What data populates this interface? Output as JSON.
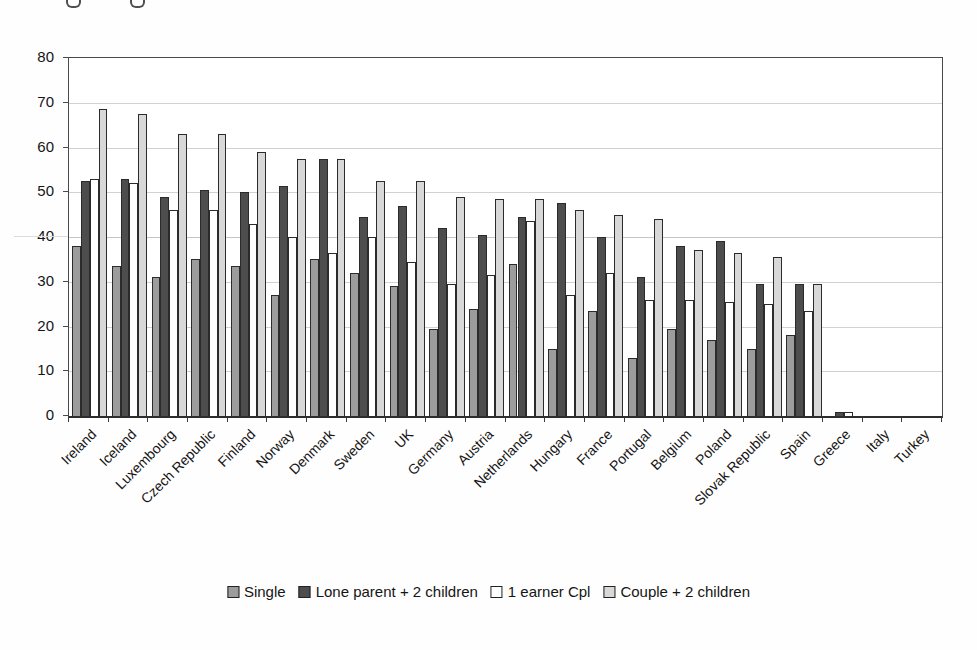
{
  "chart_data": {
    "type": "bar",
    "title": "",
    "xlabel": "",
    "ylabel": "",
    "ylim": [
      0,
      80
    ],
    "yticks": [
      0,
      10,
      20,
      30,
      40,
      50,
      60,
      70,
      80
    ],
    "grid": true,
    "legend_position": "bottom",
    "categories": [
      "Ireland",
      "Iceland",
      "Luxembourg",
      "Czech Republic",
      "Finland",
      "Norway",
      "Denmark",
      "Sweden",
      "UK",
      "Germany",
      "Austria",
      "Netherlands",
      "Hungary",
      "France",
      "Portugal",
      "Belgium",
      "Poland",
      "Slovak Republic",
      "Spain",
      "Greece",
      "Italy",
      "Turkey"
    ],
    "series": [
      {
        "name": "Single",
        "color": "#9c9c9c",
        "values": [
          38,
          33.5,
          31,
          35,
          33.5,
          27,
          35,
          32,
          29,
          19.5,
          24,
          34,
          15,
          23.5,
          13,
          19.5,
          17,
          15,
          18,
          0,
          0,
          0
        ]
      },
      {
        "name": "Lone parent + 2 children",
        "color": "#4d4d4d",
        "values": [
          52.5,
          53,
          49,
          50.5,
          50,
          51.5,
          57.5,
          44.5,
          47,
          42,
          40.5,
          44.5,
          47.5,
          40,
          31,
          38,
          39,
          29.5,
          29.5,
          1,
          0,
          0
        ]
      },
      {
        "name": "1 earner Cpl",
        "color": "#ffffff",
        "values": [
          53,
          52,
          46,
          46,
          43,
          40,
          36.5,
          40,
          34.5,
          29.5,
          31.5,
          43.5,
          27,
          32,
          26,
          26,
          25.5,
          25,
          23.5,
          1,
          0,
          0
        ]
      },
      {
        "name": "Couple + 2 children",
        "color": "#d8d8d8",
        "values": [
          68.5,
          67.5,
          63,
          63,
          59,
          57.5,
          57.5,
          52.5,
          52.5,
          49,
          48.5,
          48.5,
          46,
          45,
          44,
          37,
          36.5,
          35.5,
          29.5,
          0,
          0,
          0
        ]
      }
    ]
  }
}
